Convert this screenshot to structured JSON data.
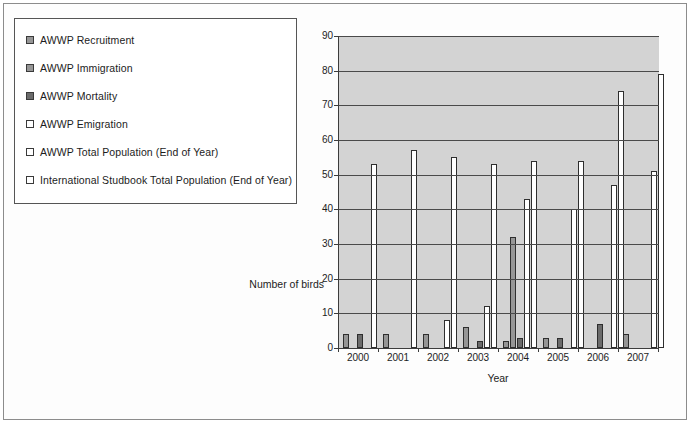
{
  "legend": {
    "items": [
      {
        "label": "AWWP Recruitment",
        "swatch": "#969696",
        "key": "recruitment"
      },
      {
        "label": "AWWP Immigration",
        "swatch": "#969696",
        "key": "immigration"
      },
      {
        "label": "AWWP Mortality",
        "swatch": "#6b6b6b",
        "key": "mortality"
      },
      {
        "label": "AWWP Emigration",
        "swatch": "#ffffff",
        "key": "emigration"
      },
      {
        "label": "AWWP Total Population (End of Year)",
        "swatch": "#ffffff",
        "key": "awwp_total"
      },
      {
        "label": "International Studbook Total Population (End of Year)",
        "swatch": "#ffffff",
        "key": "studbook_total"
      }
    ]
  },
  "chart_data": {
    "type": "bar",
    "title": "",
    "xlabel": "Year",
    "ylabel": "Number of birds",
    "ylim": [
      0,
      90
    ],
    "yticks": [
      0,
      10,
      20,
      30,
      40,
      50,
      60,
      70,
      80,
      90
    ],
    "grid": true,
    "legend_position": "outside-left",
    "plot_background": "#d3d3d3",
    "categories": [
      "2000",
      "2001",
      "2002",
      "2003",
      "2004",
      "2005",
      "2006",
      "2007"
    ],
    "series": [
      {
        "name": "AWWP Recruitment",
        "color": "#969696",
        "values": [
          4,
          4,
          4,
          6,
          2,
          3,
          0,
          4
        ]
      },
      {
        "name": "AWWP Immigration",
        "color": "#969696",
        "values": [
          0,
          0,
          0,
          0,
          32,
          0,
          0,
          0
        ]
      },
      {
        "name": "AWWP Mortality",
        "color": "#6b6b6b",
        "values": [
          4,
          0,
          0,
          2,
          3,
          3,
          7,
          0
        ]
      },
      {
        "name": "AWWP Emigration",
        "color": "#ffffff",
        "values": [
          0,
          0,
          8,
          12,
          43,
          0,
          0,
          0
        ]
      },
      {
        "name": "AWWP Total Population (End of Year)",
        "color": "#ffffff",
        "values": [
          53,
          57,
          55,
          53,
          54,
          40,
          47,
          51
        ]
      },
      {
        "name": "International Studbook Total Population (End of Year)",
        "color": "#ffffff",
        "values": [
          0,
          0,
          0,
          0,
          0,
          54,
          74,
          79
        ]
      }
    ]
  }
}
